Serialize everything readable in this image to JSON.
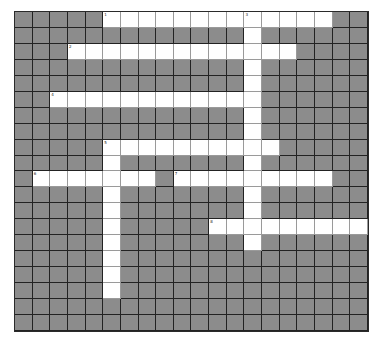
{
  "puzzle": {
    "type": "crossword",
    "rows": 20,
    "cols": 20,
    "colors": {
      "block": "#8c8c8c",
      "open": "#ffffff",
      "grid_line": "#222222"
    },
    "entries": [
      {
        "number": "1",
        "direction": "across",
        "row": 0,
        "col": 5,
        "length": 13
      },
      {
        "number": "2",
        "direction": "across",
        "row": 2,
        "col": 3,
        "length": 13
      },
      {
        "number": "3",
        "direction": "down",
        "row": 0,
        "col": 13,
        "length": 15
      },
      {
        "number": "4",
        "direction": "across",
        "row": 5,
        "col": 2,
        "length": 12
      },
      {
        "number": "5",
        "direction": "across",
        "row": 8,
        "col": 5,
        "length": 10
      },
      {
        "number": "5",
        "direction": "down",
        "row": 8,
        "col": 5,
        "length": 10
      },
      {
        "number": "6",
        "direction": "across",
        "row": 10,
        "col": 1,
        "length": 7
      },
      {
        "number": "7",
        "direction": "across",
        "row": 10,
        "col": 9,
        "length": 9
      },
      {
        "number": "8",
        "direction": "across",
        "row": 13,
        "col": 11,
        "length": 9
      }
    ]
  }
}
